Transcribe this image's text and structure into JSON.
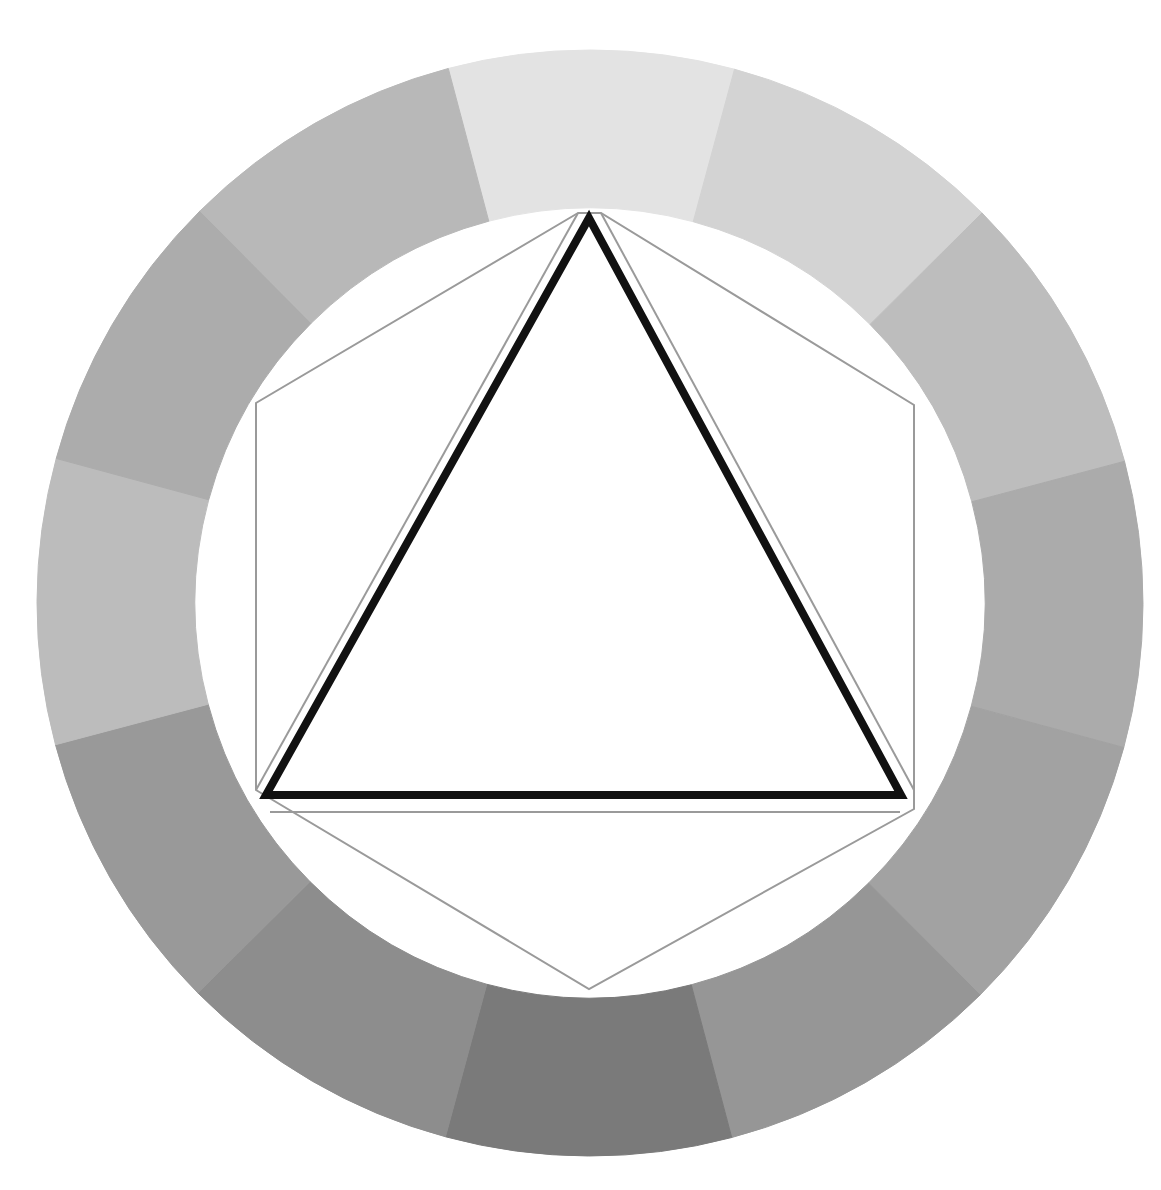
{
  "diagram": {
    "center": [
      590,
      603
    ],
    "outer_radius": 553,
    "inner_radius": 395,
    "segment_count": 12,
    "segments": [
      {
        "index": 0,
        "position": "top",
        "color": "#e3e3e3"
      },
      {
        "index": 1,
        "position": "top-right-1",
        "color": "#d3d3d3"
      },
      {
        "index": 2,
        "position": "top-right-2",
        "color": "#bdbdbd"
      },
      {
        "index": 3,
        "position": "right",
        "color": "#ababab"
      },
      {
        "index": 4,
        "position": "bottom-right-2",
        "color": "#a2a2a2"
      },
      {
        "index": 5,
        "position": "bottom-right-1",
        "color": "#969696"
      },
      {
        "index": 6,
        "position": "bottom",
        "color": "#7a7a7a"
      },
      {
        "index": 7,
        "position": "bottom-left-1",
        "color": "#8d8d8d"
      },
      {
        "index": 8,
        "position": "bottom-left-2",
        "color": "#999999"
      },
      {
        "index": 9,
        "position": "left-lower",
        "color": "#bcbcbc"
      },
      {
        "index": 10,
        "position": "left",
        "color": "#acacac"
      },
      {
        "index": 11,
        "position": "top-left-1",
        "color": "#b8b8b8"
      }
    ],
    "triangle": {
      "points": [
        [
          589,
          218
        ],
        [
          266,
          795
        ],
        [
          901,
          795
        ]
      ],
      "stroke": "#111111",
      "stroke_width": 8
    },
    "hexagon": {
      "points": [
        [
          578,
          213
        ],
        [
          256,
          403
        ],
        [
          256,
          790
        ],
        [
          589,
          989
        ],
        [
          914,
          809
        ],
        [
          914,
          405
        ],
        [
          601,
          213
        ]
      ],
      "stroke": "#9a9a9a",
      "stroke_width": 2
    },
    "inner_triangle_guides": [
      {
        "points": [
          [
            578,
            213
          ],
          [
            256,
            790
          ]
        ]
      },
      {
        "points": [
          [
            601,
            213
          ],
          [
            914,
            790
          ]
        ]
      },
      {
        "points": [
          [
            270,
            812
          ],
          [
            900,
            812
          ]
        ]
      }
    ]
  }
}
